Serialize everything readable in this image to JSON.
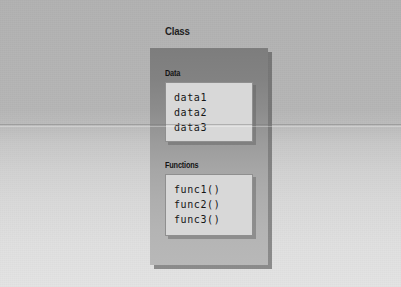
{
  "diagram": {
    "title": "Class",
    "class_box": {
      "sections": [
        {
          "name": "data-section",
          "label": "Data",
          "members": [
            "data1",
            "data2",
            "data3"
          ]
        },
        {
          "name": "functions-section",
          "label": "Functions",
          "members": [
            "func1()",
            "func2()",
            "func3()"
          ]
        }
      ]
    }
  },
  "colors": {
    "page_background_top": "#b2b2b2",
    "page_background_bottom": "#e4e4e4",
    "class_box_top": "#7d7d7d",
    "class_box_bottom": "#b8b8b8",
    "member_panel": "#d8d8d8",
    "panel_border": "#8f8f8f",
    "text": "#151515",
    "shadow": "#5f5f5f"
  }
}
